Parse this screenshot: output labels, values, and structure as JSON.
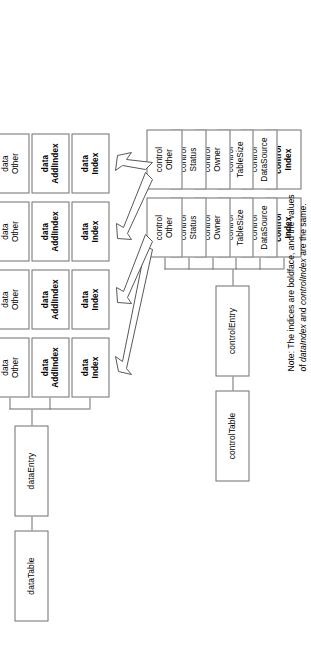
{
  "diagram": {
    "orientation": "rotated-90-ccw",
    "colors": {
      "box_border": "#6f6f6f",
      "arrow_stroke": "#585858",
      "arrow_fill": "#ffffff",
      "background": "#ffffff",
      "text": "#000000"
    },
    "data_side": {
      "root_label": "dataTable",
      "entry_label": "dataEntry",
      "columns": [
        {
          "index": 1,
          "cells": [
            {
              "line1": "data",
              "line2": "Index",
              "bold": true
            },
            {
              "line1": "data",
              "line2": "AddlIndex",
              "bold": true
            },
            {
              "line1": "data",
              "line2": "Other",
              "bold": false
            }
          ]
        },
        {
          "index": 2,
          "cells": [
            {
              "line1": "data",
              "line2": "Index",
              "bold": true
            },
            {
              "line1": "data",
              "line2": "AddlIndex",
              "bold": true
            },
            {
              "line1": "data",
              "line2": "Other",
              "bold": false
            }
          ]
        },
        {
          "index": 3,
          "cells": [
            {
              "line1": "data",
              "line2": "Index",
              "bold": true
            },
            {
              "line1": "data",
              "line2": "AddlIndex",
              "bold": true
            },
            {
              "line1": "data",
              "line2": "Other",
              "bold": false
            }
          ]
        },
        {
          "index": 4,
          "cells": [
            {
              "line1": "data",
              "line2": "Index",
              "bold": true
            },
            {
              "line1": "data",
              "line2": "AddlIndex",
              "bold": true
            },
            {
              "line1": "data",
              "line2": "Other",
              "bold": false
            }
          ]
        }
      ]
    },
    "control_side": {
      "root_label": "controlTable",
      "entry_label": "controlEntry",
      "columns": [
        {
          "index": 1,
          "cells": [
            {
              "line1": "control",
              "line2": "Index",
              "bold": true
            },
            {
              "line1": "control",
              "line2": "DataSource",
              "bold": false
            },
            {
              "line1": "control",
              "line2": "TableSize",
              "bold": false
            },
            {
              "line1": "control",
              "line2": "Owner",
              "bold": false
            },
            {
              "line1": "control",
              "line2": "Status",
              "bold": false
            },
            {
              "line1": "control",
              "line2": "Other",
              "bold": false
            }
          ]
        },
        {
          "index": 2,
          "cells": [
            {
              "line1": "control",
              "line2": "Index",
              "bold": true
            },
            {
              "line1": "control",
              "line2": "DataSource",
              "bold": false
            },
            {
              "line1": "control",
              "line2": "TableSize",
              "bold": false
            },
            {
              "line1": "control",
              "line2": "Owner",
              "bold": false
            },
            {
              "line1": "control",
              "line2": "Status",
              "bold": false
            },
            {
              "line1": "control",
              "line2": "Other",
              "bold": false
            }
          ]
        }
      ]
    },
    "arrows": [
      {
        "from": "control-other-1",
        "to": "data-index-1"
      },
      {
        "from": "control-other-1",
        "to": "data-index-2"
      },
      {
        "from": "control-other-2",
        "to": "data-index-3"
      },
      {
        "from": "control-other-2",
        "to": "data-index-4"
      }
    ],
    "note": {
      "line1_prefix": "Note: The indices are boldface, and the values",
      "line2_a": "of ",
      "line2_italic_1": "dataIndex",
      "line2_b": " and ",
      "line2_italic_2": "controlIndex",
      "line2_c": " are the same.",
      "full_text": "Note: The indices are boldface, and the values of dataIndex and controlIndex are the same."
    }
  }
}
